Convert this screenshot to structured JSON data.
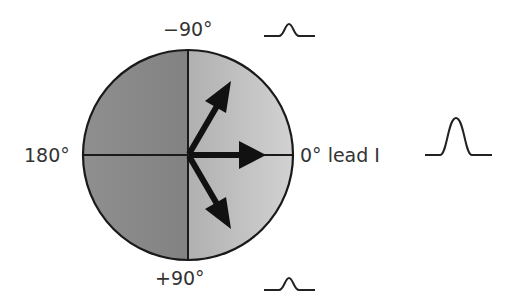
{
  "diagram": {
    "labels": {
      "top": "−90°",
      "left": "180°",
      "right": "0° lead I",
      "bottom": "+90°"
    },
    "circle": {
      "center": [
        188,
        155
      ],
      "radius": 105,
      "left_fill": "#8a8a8a",
      "right_fill": "#c4c4c4",
      "stroke": "#1a1a1a"
    },
    "vectors": [
      {
        "name": "vector-up-right",
        "angle_deg": -60,
        "description": "Vector pointing upward-right (small positive deflection in lead I)"
      },
      {
        "name": "vector-right",
        "angle_deg": 0,
        "description": "Vector parallel to lead I (maximum positive deflection)"
      },
      {
        "name": "vector-down-right",
        "angle_deg": 60,
        "description": "Vector pointing downward-right (small positive deflection in lead I)"
      }
    ],
    "waveforms": [
      {
        "name": "small-deflection-top",
        "position": "top-right",
        "amplitude": "small"
      },
      {
        "name": "large-deflection-right",
        "position": "right",
        "amplitude": "large"
      },
      {
        "name": "small-deflection-bottom",
        "position": "bottom-right",
        "amplitude": "small"
      }
    ],
    "colors": {
      "arrow": "#111111",
      "axis": "#1a1a1a",
      "waveform": "#222222",
      "text": "#333333"
    }
  }
}
